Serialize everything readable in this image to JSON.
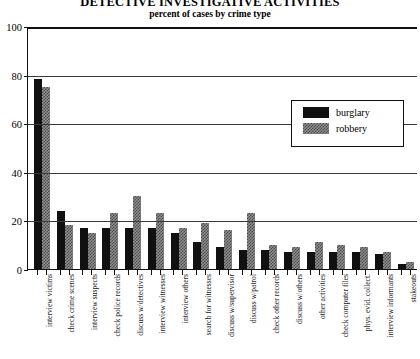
{
  "chart_data": {
    "type": "bar",
    "title": "DETECTIVE INVESTIGATIVE ACTIVITIES",
    "subtitle": "percent of cases by crime type",
    "xlabel": "",
    "ylabel": "",
    "ylim": [
      0,
      100
    ],
    "yticks": [
      0,
      20,
      40,
      60,
      80,
      100
    ],
    "grid": true,
    "legend_position": "upper-right-inside",
    "categories": [
      "interview victims",
      "check crime scenes",
      "interview suspects",
      "check police records",
      "discuss w/detectives",
      "interview witnesses",
      "interview others",
      "search for witnesses",
      "discuss w/supervisor",
      "discuss w/patrol",
      "check other records",
      "discuss w/others",
      "other activities",
      "check computer files",
      "phys. evid. collect.",
      "interview informants",
      "stakeouts"
    ],
    "series": [
      {
        "name": "burglary",
        "color": "#111111",
        "values": [
          78,
          24,
          17,
          17,
          17,
          17,
          15,
          11,
          9,
          8,
          8,
          7,
          7,
          7,
          7,
          6,
          2
        ]
      },
      {
        "name": "robbery",
        "color": "#8e8e8e",
        "values": [
          75,
          18,
          15,
          23,
          30,
          23,
          17,
          19,
          16,
          23,
          10,
          9,
          11,
          10,
          9,
          7,
          3
        ]
      }
    ]
  },
  "legend": {
    "items": [
      {
        "label": "burglary",
        "key": "burglary"
      },
      {
        "label": "robbery",
        "key": "robbery"
      }
    ]
  }
}
